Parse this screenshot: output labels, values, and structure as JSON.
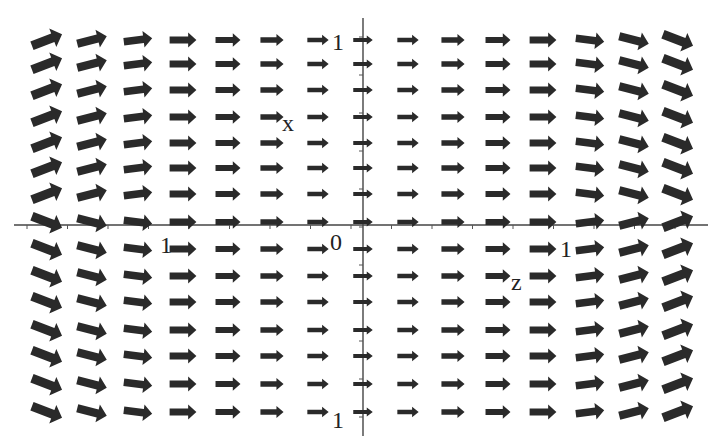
{
  "figure": {
    "type": "vector_field",
    "background": "#ffffff",
    "ink_color": "#2a2a2a",
    "axes": {
      "horizontal_label": "z",
      "vertical_label": "x",
      "origin_label": "0",
      "tick_labels": {
        "top": "1",
        "bottom": "1",
        "left": "1",
        "right": "1"
      }
    },
    "grid": {
      "columns": 15,
      "rows": 15,
      "column_x": [
        47,
        92,
        138,
        183,
        228,
        272,
        318,
        363,
        408,
        453,
        498,
        543,
        590,
        634,
        678
      ],
      "row_y": [
        40,
        64,
        90,
        117,
        143,
        168,
        194,
        222,
        249,
        276,
        302,
        330,
        356,
        384,
        412
      ],
      "center_column": 7,
      "center_row": 7
    },
    "arrow_style": {
      "icon": "right-arrow-icon",
      "base_direction": "right",
      "magnitude_grows_with_horizontal_distance": true,
      "tilt_rule": "left half tilts up above axis / down below; right half tilts down above axis / up below"
    }
  },
  "chart_data": {
    "type": "vector_field",
    "title": "",
    "xlabel": "z",
    "ylabel": "x",
    "xlim": [
      -1.75,
      1.75
    ],
    "ylim": [
      -1.1,
      1.1
    ],
    "x_ticks": [
      -1,
      0,
      1
    ],
    "y_ticks": [
      -1,
      0,
      1
    ],
    "grid": false,
    "grid_size": [
      15,
      15
    ]
  }
}
